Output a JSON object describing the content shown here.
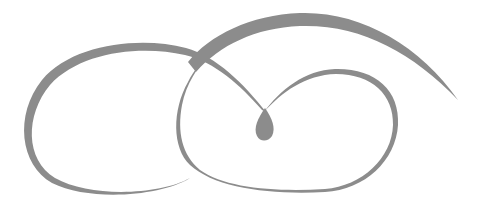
{
  "graphic": {
    "description": "Decorative calligraphic swirl flourish",
    "stroke_color": "#8c8c8c",
    "background_color": "#ffffff",
    "elements": [
      {
        "name": "left-loop",
        "shape": "open oval swirl on the left"
      },
      {
        "name": "upper-arc",
        "shape": "long sweeping arc across the top ending in a tapered tail on the right"
      },
      {
        "name": "right-loop",
        "shape": "oval loop on the right"
      },
      {
        "name": "center-teardrop",
        "shape": "teardrop drop at the center junction"
      }
    ]
  }
}
